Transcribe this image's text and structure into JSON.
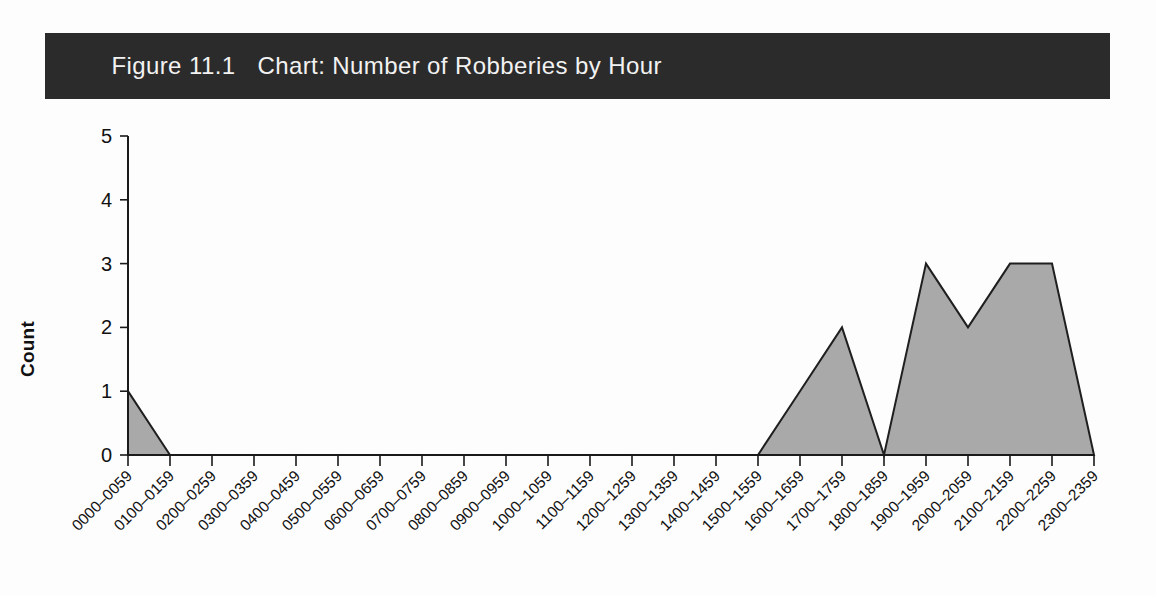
{
  "figure": {
    "number": "Figure 11.1",
    "title": "Chart: Number of Robberies by Hour",
    "title_bar_color": "#2b2b2b",
    "title_text_color": "#f2f2f2"
  },
  "chart_data": {
    "type": "area",
    "title": "Chart: Number of Robberies by Hour",
    "xlabel": "",
    "ylabel": "Count",
    "ylim": [
      0,
      5
    ],
    "yticks": [
      "0",
      "1",
      "2",
      "3",
      "4",
      "5"
    ],
    "grid": false,
    "legend": null,
    "fill_color": "#a9a9a9",
    "line_color": "#1f1f1f",
    "categories": [
      "0000–0059",
      "0100–0159",
      "0200–0259",
      "0300–0359",
      "0400–0459",
      "0500–0559",
      "0600–0659",
      "0700–0759",
      "0800–0859",
      "0900–0959",
      "1000–1059",
      "1100–1159",
      "1200–1259",
      "1300–1359",
      "1400–1459",
      "1500–1559",
      "1600–1659",
      "1700–1759",
      "1800–1859",
      "1900–1959",
      "2000–2059",
      "2100–2159",
      "2200–2259",
      "2300–2359"
    ],
    "values": [
      1,
      0,
      0,
      0,
      0,
      0,
      0,
      0,
      0,
      0,
      0,
      0,
      0,
      0,
      0,
      0,
      1,
      2,
      0,
      3,
      2,
      3,
      3,
      0
    ]
  }
}
